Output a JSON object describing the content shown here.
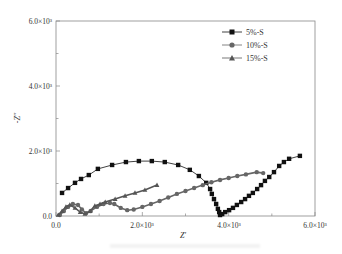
{
  "chart_data": {
    "type": "line",
    "title": "",
    "xlabel": "Z'",
    "ylabel": "-Z''",
    "xlim": [
      0,
      6000
    ],
    "ylim": [
      0,
      6000
    ],
    "x_ticks": [
      0,
      2000,
      4000,
      6000
    ],
    "x_tick_labels": [
      "0.0",
      "2.0×10³",
      "4.0×10³",
      "6.0×10³"
    ],
    "y_ticks": [
      0,
      2000,
      4000,
      6000
    ],
    "y_tick_labels": [
      "0.0",
      "2.0×10³",
      "4.0×10³",
      "6.0×10³"
    ],
    "grid": false,
    "legend_position": "upper right",
    "series": [
      {
        "name": "5%-S",
        "marker": "square",
        "color": "#111111",
        "points": [
          [
            140,
            710
          ],
          [
            280,
            860
          ],
          [
            440,
            1020
          ],
          [
            580,
            1140
          ],
          [
            760,
            1260
          ],
          [
            970,
            1450
          ],
          [
            1300,
            1570
          ],
          [
            1620,
            1660
          ],
          [
            1920,
            1690
          ],
          [
            2220,
            1690
          ],
          [
            2520,
            1660
          ],
          [
            2830,
            1570
          ],
          [
            3100,
            1420
          ],
          [
            3310,
            1230
          ],
          [
            3480,
            1020
          ],
          [
            3570,
            830
          ],
          [
            3610,
            680
          ],
          [
            3660,
            520
          ],
          [
            3710,
            370
          ],
          [
            3750,
            220
          ],
          [
            3780,
            120
          ],
          [
            3800,
            30
          ],
          [
            3850,
            60
          ],
          [
            3920,
            120
          ],
          [
            4010,
            180
          ],
          [
            4100,
            250
          ],
          [
            4190,
            340
          ],
          [
            4290,
            430
          ],
          [
            4380,
            520
          ],
          [
            4470,
            620
          ],
          [
            4560,
            710
          ],
          [
            4660,
            830
          ],
          [
            4750,
            950
          ],
          [
            4840,
            1080
          ],
          [
            4940,
            1200
          ],
          [
            5050,
            1350
          ],
          [
            5170,
            1540
          ],
          [
            5280,
            1660
          ],
          [
            5400,
            1760
          ],
          [
            5650,
            1850
          ]
        ]
      },
      {
        "name": "10%-S",
        "marker": "circle",
        "color": "#666666",
        "points": [
          [
            90,
            30
          ],
          [
            180,
            150
          ],
          [
            280,
            280
          ],
          [
            390,
            370
          ],
          [
            510,
            340
          ],
          [
            600,
            200
          ],
          [
            700,
            90
          ],
          [
            800,
            150
          ],
          [
            950,
            280
          ],
          [
            1100,
            370
          ],
          [
            1250,
            400
          ],
          [
            1350,
            370
          ],
          [
            1500,
            250
          ],
          [
            1650,
            180
          ],
          [
            1800,
            200
          ],
          [
            2000,
            280
          ],
          [
            2200,
            370
          ],
          [
            2400,
            460
          ],
          [
            2600,
            570
          ],
          [
            2800,
            680
          ],
          [
            3000,
            770
          ],
          [
            3200,
            860
          ],
          [
            3400,
            950
          ],
          [
            3600,
            1040
          ],
          [
            3800,
            1110
          ],
          [
            4000,
            1170
          ],
          [
            4200,
            1230
          ],
          [
            4400,
            1280
          ],
          [
            4650,
            1350
          ],
          [
            4800,
            1320
          ]
        ]
      },
      {
        "name": "15%-S",
        "marker": "triangle",
        "color": "#555555",
        "points": [
          [
            50,
            30
          ],
          [
            140,
            150
          ],
          [
            230,
            280
          ],
          [
            320,
            340
          ],
          [
            440,
            250
          ],
          [
            560,
            120
          ],
          [
            670,
            60
          ],
          [
            790,
            150
          ],
          [
            900,
            310
          ],
          [
            1020,
            370
          ],
          [
            1140,
            430
          ],
          [
            1370,
            520
          ],
          [
            1600,
            620
          ],
          [
            1830,
            710
          ],
          [
            2060,
            800
          ],
          [
            2340,
            950
          ]
        ]
      }
    ]
  },
  "legend": {
    "items": [
      {
        "label": "5%-S"
      },
      {
        "label": "10%-S"
      },
      {
        "label": "15%-S"
      }
    ]
  },
  "axes": {
    "x_label": "Z'",
    "y_label": "-Z''",
    "x_tick_labels": [
      "0.0",
      "2.0×10³",
      "4.0×10³",
      "6.0×10³"
    ],
    "y_tick_labels": [
      "0.0",
      "2.0×10³",
      "4.0×10³",
      "6.0×10³"
    ]
  }
}
